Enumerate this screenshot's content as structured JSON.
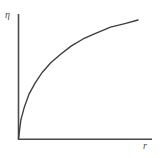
{
  "figure": {
    "background_color": "#ffffff",
    "ink_color": "#4a4a4a",
    "curve_color": "#3d3d3d"
  },
  "chart_data": {
    "type": "line",
    "title": "",
    "subtitle": "",
    "xlabel": "r",
    "ylabel": "η",
    "grid": false,
    "legend": null,
    "tick_labels": {
      "x": [],
      "y": []
    },
    "xlim": [
      0,
      1
    ],
    "ylim": [
      0,
      1
    ],
    "annotations": [],
    "series": [
      {
        "name": "η(r)",
        "comment": "monotonically increasing, concave, saturating square-root-like curve from the origin",
        "x": [
          0.0,
          0.02,
          0.05,
          0.09,
          0.14,
          0.2,
          0.27,
          0.35,
          0.44,
          0.54,
          0.65,
          0.77,
          0.89,
          1.0
        ],
        "y": [
          0.0,
          0.16,
          0.27,
          0.38,
          0.47,
          0.56,
          0.64,
          0.71,
          0.78,
          0.84,
          0.89,
          0.94,
          0.97,
          1.0
        ]
      }
    ],
    "axes": {
      "y_axis": {
        "x": 18,
        "y_top": 14,
        "y_bottom": 139
      },
      "x_axis": {
        "y": 139,
        "x_left": 18,
        "x_right": 152
      }
    },
    "curve_pixels": {
      "start": [
        18,
        139
      ],
      "end": [
        138,
        20
      ]
    }
  }
}
